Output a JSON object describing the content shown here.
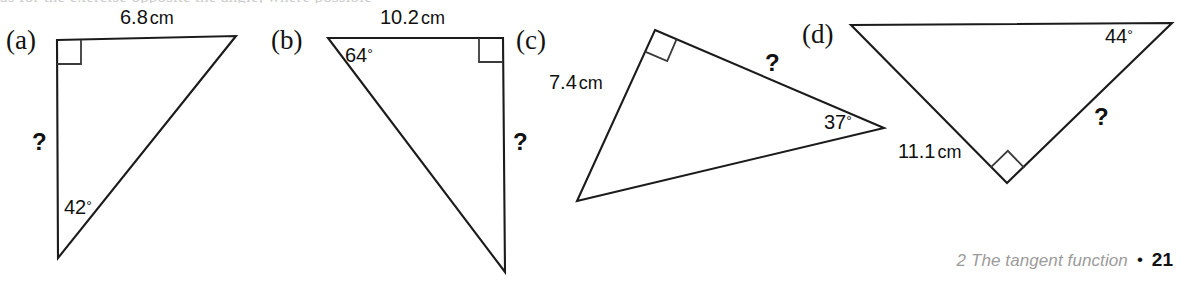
{
  "page": {
    "clipped_top_line": "as for the exercise opposite the angle, where possible",
    "background_color": "#ffffff",
    "ink_color": "#1b1b1b"
  },
  "figures": [
    {
      "id": "a",
      "part_label": "(a)",
      "labels": {
        "top_side": "6.8",
        "top_side_unit": "cm",
        "left_side": "?",
        "bottom_angle": "42",
        "degree_symbol": "°"
      },
      "right_angle_at": "top-left",
      "vertices": "57,40 236,36 58,258"
    },
    {
      "id": "b",
      "part_label": "(b)",
      "labels": {
        "top_side": "10.2",
        "top_side_unit": "cm",
        "right_side": "?",
        "top_left_angle": "64",
        "degree_symbol": "°"
      },
      "right_angle_at": "top-right",
      "vertices": "328,38 503,38 505,272"
    },
    {
      "id": "c",
      "part_label": "(c)",
      "labels": {
        "left_side": "7.4",
        "left_side_unit": "cm",
        "upper_right_side": "?",
        "right_angle_value": "37",
        "degree_symbol": "°"
      },
      "right_angle_at": "apex",
      "vertices": "655,30 884,128 577,201"
    },
    {
      "id": "d",
      "part_label": "(d)",
      "labels": {
        "left_side": "11.1",
        "left_side_unit": "cm",
        "right_side": "?",
        "top_right_angle": "44",
        "degree_symbol": "°"
      },
      "right_angle_at": "bottom",
      "vertices": "851,25 1172,23 1007,183"
    }
  ],
  "footer": {
    "chapter": "2 The tangent function",
    "bullet": "•",
    "page_number": "21",
    "chapter_color": "#9b9b9b",
    "page_number_color": "#111111"
  }
}
